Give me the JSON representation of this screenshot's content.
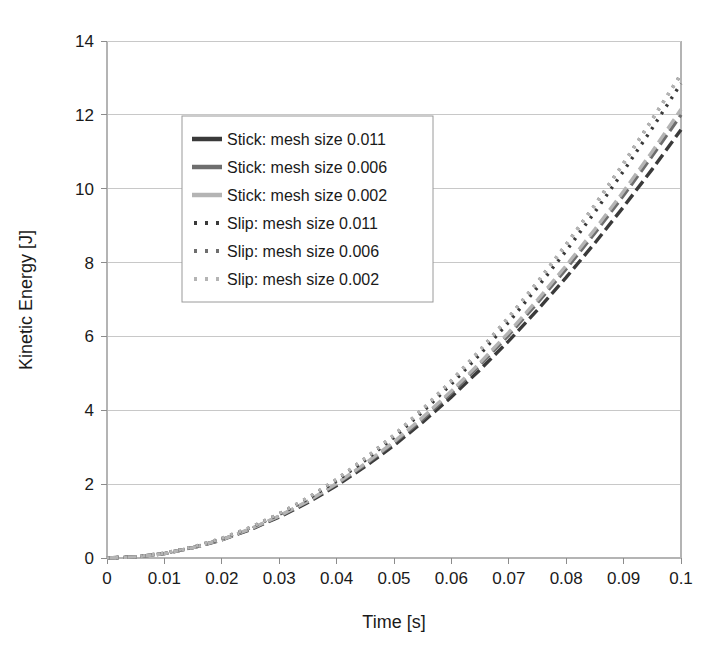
{
  "chart_data": {
    "type": "line",
    "title": "",
    "xlabel": "Time [s]",
    "ylabel": "Kinetic Energy [J]",
    "xlim": [
      0,
      0.1
    ],
    "ylim": [
      0,
      14
    ],
    "xticks": [
      "0",
      "0.01",
      "0.02",
      "0.03",
      "0.04",
      "0.05",
      "0.06",
      "0.07",
      "0.08",
      "0.09",
      "0.1"
    ],
    "xtick_values": [
      0,
      0.01,
      0.02,
      0.03,
      0.04,
      0.05,
      0.06,
      0.07,
      0.08,
      0.09,
      0.1
    ],
    "yticks": [
      "0",
      "2",
      "4",
      "6",
      "8",
      "10",
      "12",
      "14"
    ],
    "ytick_values": [
      0,
      2,
      4,
      6,
      8,
      10,
      12,
      14
    ],
    "grid": "horizontal",
    "legend_position": "upper-left-inside",
    "x": [
      0,
      0.005,
      0.01,
      0.015,
      0.02,
      0.025,
      0.03,
      0.035,
      0.04,
      0.045,
      0.05,
      0.055,
      0.06,
      0.065,
      0.07,
      0.075,
      0.08,
      0.085,
      0.09,
      0.095,
      0.1
    ],
    "series": [
      {
        "name": "Stick: mesh size 0.011",
        "color": "#3a3a3a",
        "dash": "solid",
        "linewidth": 3.4,
        "values": [
          0,
          0.03,
          0.12,
          0.28,
          0.49,
          0.77,
          1.11,
          1.5,
          1.96,
          2.48,
          3.05,
          3.68,
          4.36,
          5.1,
          5.88,
          6.72,
          7.6,
          8.53,
          9.51,
          10.53,
          11.6
        ]
      },
      {
        "name": "Stick: mesh size 0.006",
        "color": "#6e6e6e",
        "dash": "solid",
        "linewidth": 3.4,
        "values": [
          0,
          0.03,
          0.12,
          0.28,
          0.5,
          0.78,
          1.13,
          1.53,
          2.0,
          2.53,
          3.12,
          3.76,
          4.47,
          5.23,
          6.04,
          6.91,
          7.83,
          8.8,
          9.82,
          10.89,
          12.0
        ]
      },
      {
        "name": "Stick: mesh size 0.002",
        "color": "#b4b4b4",
        "dash": "solid",
        "linewidth": 3.4,
        "values": [
          0,
          0.03,
          0.12,
          0.28,
          0.5,
          0.79,
          1.14,
          1.54,
          2.02,
          2.56,
          3.15,
          3.81,
          4.52,
          5.29,
          6.11,
          6.99,
          7.92,
          8.9,
          9.93,
          11.01,
          12.15
        ]
      },
      {
        "name": "Slip: mesh size 0.011",
        "color": "#3a3a3a",
        "dash": "dotted",
        "linewidth": 3.4,
        "values": [
          0,
          0.03,
          0.13,
          0.29,
          0.52,
          0.82,
          1.18,
          1.6,
          2.09,
          2.65,
          3.27,
          3.96,
          4.71,
          5.52,
          6.39,
          7.33,
          8.32,
          9.37,
          10.48,
          11.64,
          12.85
        ]
      },
      {
        "name": "Slip: mesh size 0.006",
        "color": "#6e6e6e",
        "dash": "dotted",
        "linewidth": 3.4,
        "values": [
          0,
          0.03,
          0.13,
          0.3,
          0.53,
          0.83,
          1.2,
          1.63,
          2.13,
          2.7,
          3.33,
          4.03,
          4.8,
          5.63,
          6.52,
          7.47,
          8.49,
          9.56,
          10.69,
          11.88,
          13.1
        ]
      },
      {
        "name": "Slip: mesh size 0.002",
        "color": "#b4b4b4",
        "dash": "dotted",
        "linewidth": 3.4,
        "values": [
          0,
          0.03,
          0.13,
          0.3,
          0.53,
          0.83,
          1.2,
          1.63,
          2.13,
          2.7,
          3.33,
          4.03,
          4.8,
          5.63,
          6.52,
          7.47,
          8.49,
          9.56,
          10.69,
          11.88,
          13.1
        ]
      }
    ]
  },
  "legend": {
    "entries": [
      {
        "label": "Stick: mesh size 0.011",
        "color": "#3a3a3a",
        "style": "solid"
      },
      {
        "label": "Stick: mesh size 0.006",
        "color": "#6e6e6e",
        "style": "solid"
      },
      {
        "label": "Stick: mesh size 0.002",
        "color": "#b4b4b4",
        "style": "solid"
      },
      {
        "label": "Slip: mesh size 0.011",
        "color": "#3a3a3a",
        "style": "dotted"
      },
      {
        "label": "Slip: mesh size 0.006",
        "color": "#6e6e6e",
        "style": "dotted"
      },
      {
        "label": "Slip: mesh size 0.002",
        "color": "#b4b4b4",
        "style": "dotted"
      }
    ]
  },
  "plot_geometry": {
    "left": 107,
    "right": 681,
    "top": 41,
    "bottom": 558
  },
  "colors": {
    "background": "#ffffff",
    "gridline": "#c8c8c8",
    "axis": "#b4b4b4",
    "text": "#1a1a1a",
    "dark_series": "#3a3a3a",
    "mid_series": "#6e6e6e",
    "light_series": "#b4b4b4"
  }
}
